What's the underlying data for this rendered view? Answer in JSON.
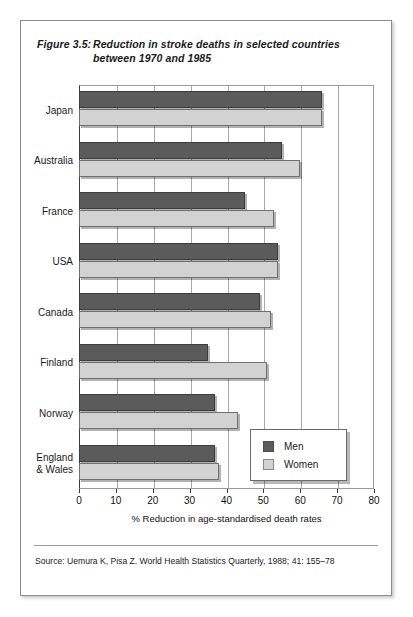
{
  "figure": {
    "number": "Figure 3.5:",
    "title_line1": "Reduction in stroke deaths in selected countries",
    "title_line2": "between 1970 and 1985"
  },
  "source": {
    "text": "Source: Uemura K, Pisa Z. World Health Statistics Quarterly, 1988; 41: 155–78"
  },
  "legend": {
    "men_label": "Men",
    "women_label": "Women"
  },
  "colors": {
    "men": "#5b5b5b",
    "women": "#d2d2d2",
    "frame": "#9a9a9a",
    "axis": "#3a3a3a",
    "page_border": "#8d8d8d"
  },
  "chart_data": {
    "type": "bar",
    "orientation": "horizontal",
    "title": "Reduction in stroke deaths in selected countries between 1970 and 1985",
    "xlabel": "% Reduction in age-standardised death rates",
    "ylabel": "",
    "xlim": [
      0,
      80
    ],
    "xticks": [
      0,
      10,
      20,
      30,
      40,
      50,
      60,
      70,
      80
    ],
    "xtick_labels": [
      "0",
      "10",
      "20",
      "30",
      "40",
      "50",
      "60",
      "70",
      "80"
    ],
    "grid": true,
    "legend_position": "lower-right-inside",
    "categories": [
      "Japan",
      "Australia",
      "France",
      "USA",
      "Canada",
      "Finland",
      "Norway",
      "England & Wales"
    ],
    "category_labels": [
      [
        "Japan"
      ],
      [
        "Australia"
      ],
      [
        "France"
      ],
      [
        "USA"
      ],
      [
        "Canada"
      ],
      [
        "Finland"
      ],
      [
        "Norway"
      ],
      [
        "England",
        "& Wales"
      ]
    ],
    "series": [
      {
        "name": "Men",
        "color": "#5b5b5b",
        "values": [
          66,
          55,
          45,
          54,
          49,
          35,
          37,
          37
        ]
      },
      {
        "name": "Women",
        "color": "#d2d2d2",
        "values": [
          66,
          60,
          53,
          54,
          52,
          51,
          43,
          38
        ]
      }
    ]
  }
}
